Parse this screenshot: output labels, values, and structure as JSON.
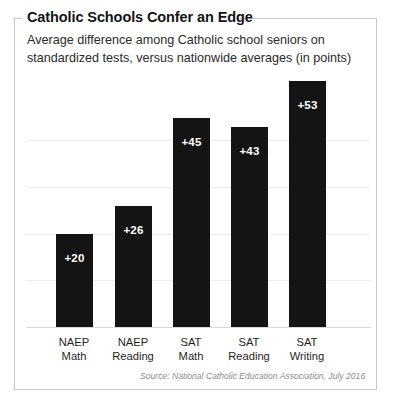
{
  "title": "Catholic Schools Confer an Edge",
  "subtitle": "Average difference among Catholic school seniors on standardized tests, versus nationwide averages (in points)",
  "source": "Source: National Catholic Education Association, July 2016",
  "colors": {
    "bar": "#141414",
    "frame": "#c9c9c9",
    "gridline": "#ededed",
    "baseline": "#d7d7d7",
    "value_label": "#ffffff",
    "background": "#ffffff"
  },
  "chart_data": {
    "type": "bar",
    "title": "Catholic Schools Confer an Edge",
    "subtitle": "Average difference among Catholic school seniors on standardized tests, versus nationwide averages (in points)",
    "xlabel": "",
    "ylabel": "",
    "ylim": [
      0,
      60
    ],
    "grid": true,
    "legend": "none",
    "gridline_values": [
      10,
      20,
      30,
      40
    ],
    "categories": [
      "NAEP Math",
      "NAEP Reading",
      "SAT Math",
      "SAT Reading",
      "SAT Writing"
    ],
    "category_lines": [
      {
        "line1": "NAEP",
        "line2": "Math"
      },
      {
        "line1": "NAEP",
        "line2": "Reading"
      },
      {
        "line1": "SAT",
        "line2": "Math"
      },
      {
        "line1": "SAT",
        "line2": "Reading"
      },
      {
        "line1": "SAT",
        "line2": "Writing"
      }
    ],
    "values": [
      20,
      26,
      45,
      43,
      53
    ],
    "data_labels": [
      "+20",
      "+26",
      "+45",
      "+43",
      "+53"
    ]
  }
}
